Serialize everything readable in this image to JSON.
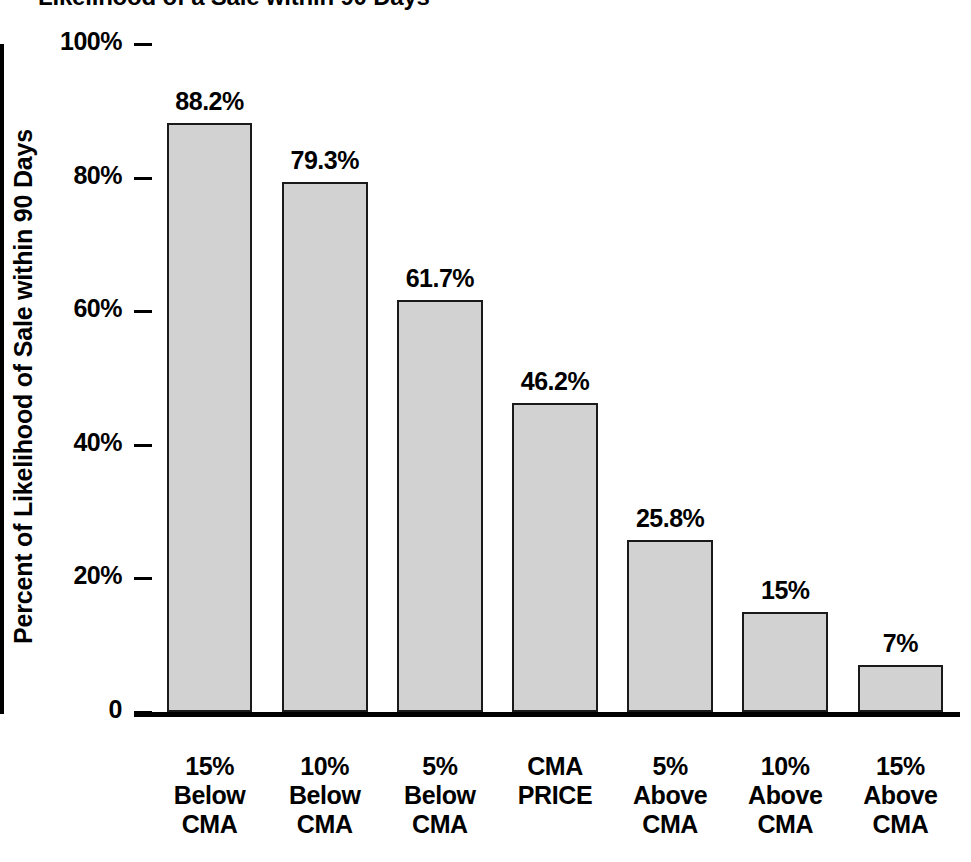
{
  "chart_data": {
    "type": "bar",
    "title": "Likelihood of a Sale within 90 Days",
    "xlabel": "",
    "ylabel": "Percent of Likelihood of Sale within 90 Days",
    "ylim": [
      0,
      100
    ],
    "grid": false,
    "legend": "none",
    "y_ticks": [
      "0",
      "20%",
      "40%",
      "60%",
      "80%",
      "100%"
    ],
    "y_tick_values": [
      0,
      20,
      40,
      60,
      80,
      100
    ],
    "categories": [
      "15% Below CMA",
      "10% Below CMA",
      "5% Below CMA",
      "CMA PRICE",
      "5% Above CMA",
      "10% Above CMA",
      "15% Above CMA"
    ],
    "category_lines": [
      [
        "15%",
        "Below",
        "CMA"
      ],
      [
        "10%",
        "Below",
        "CMA"
      ],
      [
        "5%",
        "Below",
        "CMA"
      ],
      [
        "CMA",
        "PRICE"
      ],
      [
        "5%",
        "Above",
        "CMA"
      ],
      [
        "10%",
        "Above",
        "CMA"
      ],
      [
        "15%",
        "Above",
        "CMA"
      ]
    ],
    "values": [
      88.2,
      79.3,
      61.7,
      46.2,
      25.8,
      15,
      7
    ],
    "value_labels": [
      "88.2%",
      "79.3%",
      "61.7%",
      "46.2%",
      "25.8%",
      "15%",
      "7%"
    ],
    "bar_fill_color": "#d2d2d2",
    "bar_edge_color": "#1a1a1a",
    "axis_color": "#000000",
    "background_color": "#ffffff"
  }
}
